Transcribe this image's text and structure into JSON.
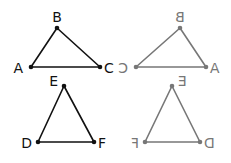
{
  "diagram": {
    "colors": {
      "original": "#111111",
      "mirror": "#777777"
    },
    "triangles": [
      {
        "id": "ABC",
        "vertices": [
          {
            "label": "B",
            "x": 57,
            "y": 28,
            "lx": 57,
            "ly": 22,
            "anchor": "middle"
          },
          {
            "label": "A",
            "x": 31,
            "y": 67,
            "lx": 23,
            "ly": 73,
            "anchor": "end"
          },
          {
            "label": "C",
            "x": 100,
            "y": 67,
            "lx": 104,
            "ly": 73,
            "anchor": "start"
          }
        ]
      },
      {
        "id": "ABC-mirror",
        "vertices": [
          {
            "label": "B",
            "x": 180,
            "y": 28,
            "lx": 180,
            "ly": 22,
            "anchor": "middle"
          },
          {
            "label": "C",
            "x": 136,
            "y": 67,
            "lx": 128,
            "ly": 73,
            "anchor": "end"
          },
          {
            "label": "A",
            "x": 206,
            "y": 67,
            "lx": 210,
            "ly": 73,
            "anchor": "start"
          }
        ]
      },
      {
        "id": "DEF",
        "vertices": [
          {
            "label": "E",
            "x": 64,
            "y": 86,
            "lx": 58,
            "ly": 86,
            "anchor": "end"
          },
          {
            "label": "D",
            "x": 38,
            "y": 142,
            "lx": 32,
            "ly": 148,
            "anchor": "end"
          },
          {
            "label": "F",
            "x": 94,
            "y": 142,
            "lx": 98,
            "ly": 148,
            "anchor": "start"
          }
        ]
      },
      {
        "id": "DEF-mirror",
        "vertices": [
          {
            "label": "E",
            "x": 172,
            "y": 86,
            "lx": 178,
            "ly": 86,
            "anchor": "start"
          },
          {
            "label": "F",
            "x": 145,
            "y": 142,
            "lx": 139,
            "ly": 148,
            "anchor": "end"
          },
          {
            "label": "D",
            "x": 200,
            "y": 142,
            "lx": 204,
            "ly": 148,
            "anchor": "start"
          }
        ]
      }
    ]
  }
}
